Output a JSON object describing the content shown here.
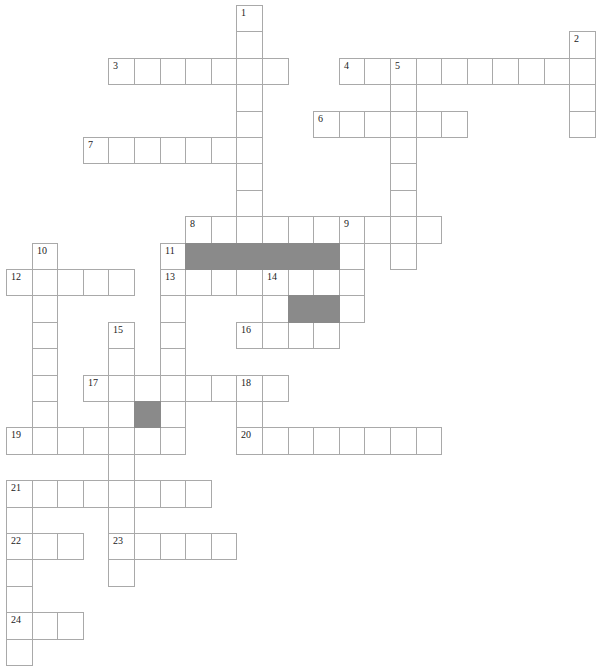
{
  "puzzle": {
    "type": "crossword",
    "cell_width": 25.6,
    "cell_height": 26.4,
    "origin_x": 6,
    "origin_y": 5,
    "colors": {
      "line": "#a9a9a9",
      "block": "#8a8a8a",
      "cell": "#ffffff",
      "number": "#222222"
    },
    "entries": [
      {
        "number": "1",
        "direction": "down",
        "col": 9,
        "row": 0,
        "length": 9
      },
      {
        "number": "2",
        "direction": "down",
        "col": 22,
        "row": 1,
        "length": 4
      },
      {
        "number": "3",
        "direction": "across",
        "col": 4,
        "row": 2,
        "length": 7
      },
      {
        "number": "4",
        "direction": "across",
        "col": 13,
        "row": 2,
        "length": 10
      },
      {
        "number": "5",
        "direction": "down",
        "col": 15,
        "row": 2,
        "length": 8
      },
      {
        "number": "6",
        "direction": "across",
        "col": 12,
        "row": 4,
        "length": 6
      },
      {
        "number": "7",
        "direction": "across",
        "col": 3,
        "row": 5,
        "length": 7
      },
      {
        "number": "8",
        "direction": "across",
        "col": 7,
        "row": 8,
        "length": 10
      },
      {
        "number": "9",
        "direction": "down",
        "col": 13,
        "row": 8,
        "length": 4
      },
      {
        "number": "10",
        "direction": "down",
        "col": 1,
        "row": 9,
        "length": 7
      },
      {
        "number": "11",
        "direction": "down",
        "col": 6,
        "row": 9,
        "length": 8
      },
      {
        "number": "12",
        "direction": "across",
        "col": 0,
        "row": 10,
        "length": 5
      },
      {
        "number": "13",
        "direction": "across",
        "col": 6,
        "row": 10,
        "length": 8
      },
      {
        "number": "14",
        "direction": "down",
        "col": 10,
        "row": 10,
        "length": 3
      },
      {
        "number": "15",
        "direction": "down",
        "col": 4,
        "row": 12,
        "length": 10
      },
      {
        "number": "16",
        "direction": "across",
        "col": 9,
        "row": 12,
        "length": 4
      },
      {
        "number": "17",
        "direction": "across",
        "col": 3,
        "row": 14,
        "length": 8
      },
      {
        "number": "18",
        "direction": "down",
        "col": 9,
        "row": 14,
        "length": 3
      },
      {
        "number": "19",
        "direction": "across",
        "col": 0,
        "row": 16,
        "length": 7
      },
      {
        "number": "20",
        "direction": "across",
        "col": 9,
        "row": 16,
        "length": 8
      },
      {
        "number": "21",
        "direction": "across",
        "col": 0,
        "row": 18,
        "length": 8
      },
      {
        "number": "21",
        "direction": "down",
        "col": 0,
        "row": 18,
        "length": 7
      },
      {
        "number": "22",
        "direction": "across",
        "col": 0,
        "row": 20,
        "length": 3
      },
      {
        "number": "23",
        "direction": "across",
        "col": 4,
        "row": 20,
        "length": 5
      },
      {
        "number": "24",
        "direction": "across",
        "col": 0,
        "row": 23,
        "length": 3
      }
    ],
    "blocks": [
      {
        "col": 7,
        "row": 9
      },
      {
        "col": 8,
        "row": 9
      },
      {
        "col": 9,
        "row": 9
      },
      {
        "col": 10,
        "row": 9
      },
      {
        "col": 11,
        "row": 9
      },
      {
        "col": 12,
        "row": 9
      },
      {
        "col": 11,
        "row": 11
      },
      {
        "col": 12,
        "row": 11
      },
      {
        "col": 5,
        "row": 15
      }
    ]
  }
}
